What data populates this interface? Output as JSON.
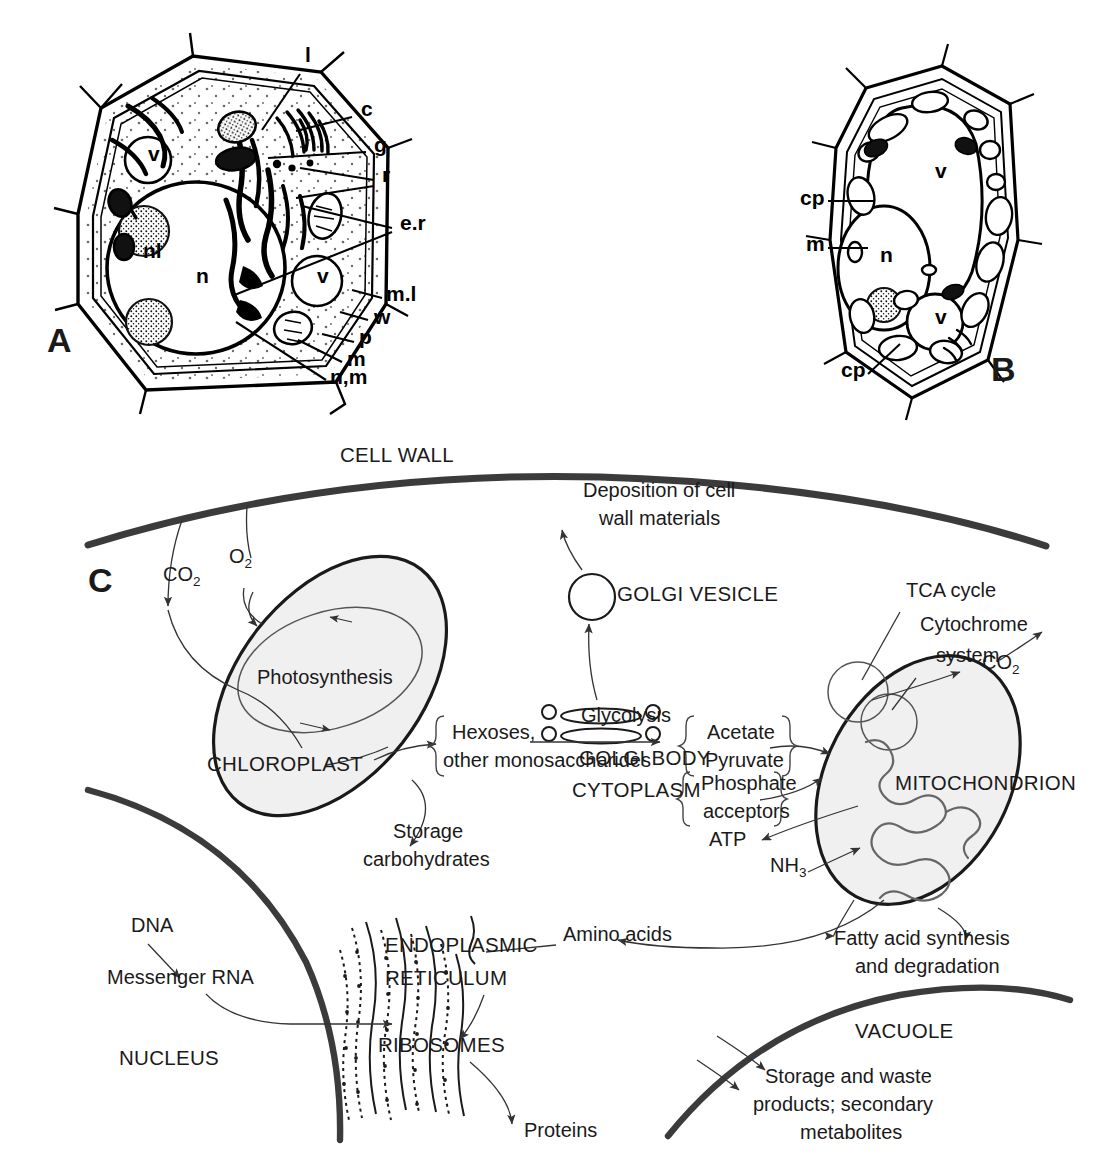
{
  "figure": {
    "panels": [
      "A",
      "B",
      "C"
    ]
  },
  "panel_a": {
    "id": "A",
    "caption_labels": [
      {
        "key": "l",
        "text": "l",
        "x": 305,
        "y": 62
      },
      {
        "key": "c",
        "text": "c",
        "x": 361,
        "y": 116
      },
      {
        "key": "g",
        "text": "g",
        "x": 374,
        "y": 152
      },
      {
        "key": "r",
        "text": "r",
        "x": 382,
        "y": 182
      },
      {
        "key": "e.r",
        "text": "e.r",
        "x": 400,
        "y": 230
      },
      {
        "key": "m.l",
        "text": "m.l",
        "x": 386,
        "y": 301
      },
      {
        "key": "w",
        "text": "w",
        "x": 374,
        "y": 324
      },
      {
        "key": "p",
        "text": "p",
        "x": 359,
        "y": 344
      },
      {
        "key": "m",
        "text": "m",
        "x": 347,
        "y": 366
      },
      {
        "key": "n,m",
        "text": "n,m",
        "x": 330,
        "y": 384
      }
    ],
    "interior_labels": [
      {
        "key": "v-top",
        "text": "v",
        "x": 148,
        "y": 161
      },
      {
        "key": "nl",
        "text": "nl",
        "x": 143,
        "y": 258
      },
      {
        "key": "n",
        "text": "n",
        "x": 196,
        "y": 283
      },
      {
        "key": "v-mid",
        "text": "v",
        "x": 317,
        "y": 283
      }
    ],
    "panel_letter": {
      "text": "A",
      "x": 47,
      "y": 352
    }
  },
  "panel_b": {
    "id": "B",
    "caption_labels": [
      {
        "key": "cp-top",
        "text": "cp",
        "x": 800,
        "y": 205
      },
      {
        "key": "m",
        "text": "m",
        "x": 806,
        "y": 251
      },
      {
        "key": "cp-bot",
        "text": "cp",
        "x": 841,
        "y": 377
      }
    ],
    "interior_labels": [
      {
        "key": "v-big",
        "text": "v",
        "x": 935,
        "y": 178
      },
      {
        "key": "n",
        "text": "n",
        "x": 880,
        "y": 262
      },
      {
        "key": "v-sml",
        "text": "v",
        "x": 935,
        "y": 324
      }
    ],
    "panel_letter": {
      "text": "B",
      "x": 991,
      "y": 381
    }
  },
  "panel_c": {
    "id": "C",
    "panel_letter": {
      "text": "C",
      "x": 88,
      "y": 592
    },
    "compartments": [
      {
        "key": "cell-wall",
        "label": "CELL WALL",
        "x": 340,
        "y": 462
      },
      {
        "key": "cytoplasm",
        "label": "CYTOPLASM",
        "x": 572,
        "y": 797
      },
      {
        "key": "nucleus",
        "label": "NUCLEUS",
        "x": 119,
        "y": 1065
      },
      {
        "key": "vacuole",
        "label": "VACUOLE",
        "x": 855,
        "y": 1038
      }
    ],
    "organelles": [
      {
        "key": "chloroplast",
        "label": "CHLOROPLAST",
        "x": 207,
        "y": 771
      },
      {
        "key": "photosynthesis",
        "label": "Photosynthesis",
        "x": 257,
        "y": 684
      },
      {
        "key": "mitochondrion",
        "label": "MITOCHONDRION",
        "x": 895,
        "y": 790
      },
      {
        "key": "golgi-vesicle",
        "label": "GOLGI VESICLE",
        "x": 617,
        "y": 601
      },
      {
        "key": "golgi-body",
        "label": "GOLGI BODY",
        "x": 579,
        "y": 765
      },
      {
        "key": "er",
        "label": "ENDOPLASMIC",
        "x": 385,
        "y": 952
      },
      {
        "key": "er2",
        "label": "RETICULUM",
        "x": 385,
        "y": 985
      },
      {
        "key": "ribosomes",
        "label": "RIBOSOMES",
        "x": 378,
        "y": 1052
      }
    ],
    "molecules": [
      {
        "key": "co2-in",
        "label": "CO",
        "sub": "2",
        "x": 163,
        "y": 581
      },
      {
        "key": "o2-out",
        "label": "O",
        "sub": "2",
        "x": 229,
        "y": 563
      },
      {
        "key": "co2-mito",
        "label": "CO",
        "sub": "2",
        "x": 982,
        "y": 669
      },
      {
        "key": "nh3",
        "label": "NH",
        "sub": "3",
        "x": 770,
        "y": 872
      },
      {
        "key": "atp",
        "label": "ATP",
        "sub": "",
        "x": 709,
        "y": 846
      }
    ],
    "processes": [
      {
        "key": "glycolysis",
        "label": "Glycolysis",
        "x": 581,
        "y": 722
      },
      {
        "key": "tca",
        "label": "TCA cycle",
        "x": 906,
        "y": 597
      },
      {
        "key": "cytochrome-1",
        "label": "Cytochrome",
        "x": 920,
        "y": 631
      },
      {
        "key": "cytochrome-2",
        "label": "system",
        "x": 936,
        "y": 662
      }
    ],
    "metabolites": [
      {
        "key": "hexoses-1",
        "label": "Hexoses,",
        "x": 452,
        "y": 739
      },
      {
        "key": "hexoses-2",
        "label": "other monosaccharides",
        "x": 443,
        "y": 767
      },
      {
        "key": "acetate",
        "label": "Acetate",
        "x": 707,
        "y": 739
      },
      {
        "key": "pyruvate",
        "label": "Pyruvate",
        "x": 705,
        "y": 767
      },
      {
        "key": "phosphate-1",
        "label": "Phosphate",
        "x": 701,
        "y": 790
      },
      {
        "key": "phosphate-2",
        "label": "acceptors",
        "x": 703,
        "y": 818
      },
      {
        "key": "amino-acids",
        "label": "Amino acids",
        "x": 563,
        "y": 941
      },
      {
        "key": "proteins",
        "label": "Proteins",
        "x": 524,
        "y": 1137
      },
      {
        "key": "dna",
        "label": "DNA",
        "x": 131,
        "y": 932
      },
      {
        "key": "mrna",
        "label": "Messenger RNA",
        "x": 107,
        "y": 984
      }
    ],
    "outputs": [
      {
        "key": "deposition-1",
        "label": "Deposition of cell",
        "x": 583,
        "y": 497
      },
      {
        "key": "deposition-2",
        "label": "wall materials",
        "x": 599,
        "y": 525
      },
      {
        "key": "storage-1",
        "label": "Storage",
        "x": 393,
        "y": 838
      },
      {
        "key": "storage-2",
        "label": "carbohydrates",
        "x": 363,
        "y": 866
      },
      {
        "key": "fatty-1",
        "label": "Fatty acid synthesis",
        "x": 834,
        "y": 945
      },
      {
        "key": "fatty-2",
        "label": "and degradation",
        "x": 855,
        "y": 973
      },
      {
        "key": "vac-1",
        "label": "Storage and waste",
        "x": 765,
        "y": 1083
      },
      {
        "key": "vac-2",
        "label": "products; secondary",
        "x": 753,
        "y": 1111
      },
      {
        "key": "vac-3",
        "label": "metabolites",
        "x": 800,
        "y": 1139
      }
    ]
  },
  "colors": {
    "ink": "#1a1a1a",
    "wall": "#3b3b3b",
    "organelle_fill": "#f0f0f0",
    "cristae": "#666666",
    "background": "#ffffff"
  }
}
